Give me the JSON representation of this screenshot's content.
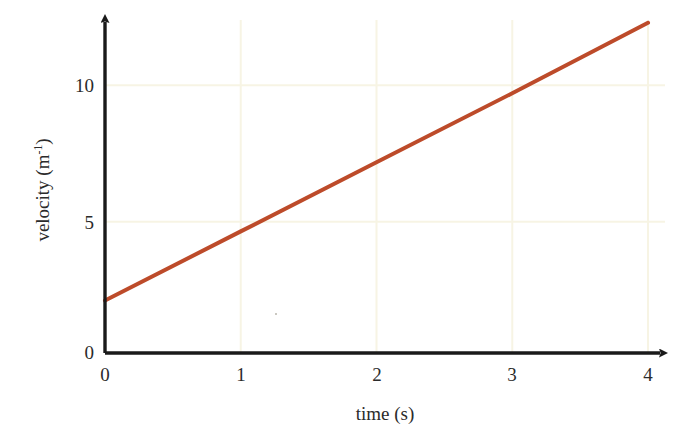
{
  "chart_data": {
    "type": "line",
    "title": "",
    "xlabel": "time (s)",
    "ylabel": "velocity (m<sup>-1</sup>)",
    "ylabel_text": "velocity (m",
    "ylabel_exponent": "-1",
    "ylabel_tail": ")",
    "xlim": [
      0,
      4
    ],
    "ylim": [
      0,
      12.05
    ],
    "xticks": [
      "0",
      "1",
      "2",
      "3",
      "4"
    ],
    "xtick_values": [
      0,
      1,
      2,
      3,
      4
    ],
    "yticks": [
      "0",
      "5",
      "10"
    ],
    "ytick_values": [
      0,
      5,
      10
    ],
    "grid": true,
    "grid_color": "#f7f4e4",
    "legend": "none",
    "axis_color": "#1a1a1a",
    "series": [
      {
        "name": "velocity",
        "color": "#bd4b2a",
        "line_width": 4,
        "x": [
          0,
          1,
          2,
          3,
          4
        ],
        "values": [
          1.9,
          4.4,
          6.9,
          9.4,
          11.95
        ],
        "intercept": 1.9,
        "slope": 2.5
      }
    ]
  },
  "axes": {
    "x_arrow": true,
    "y_arrow": true
  }
}
